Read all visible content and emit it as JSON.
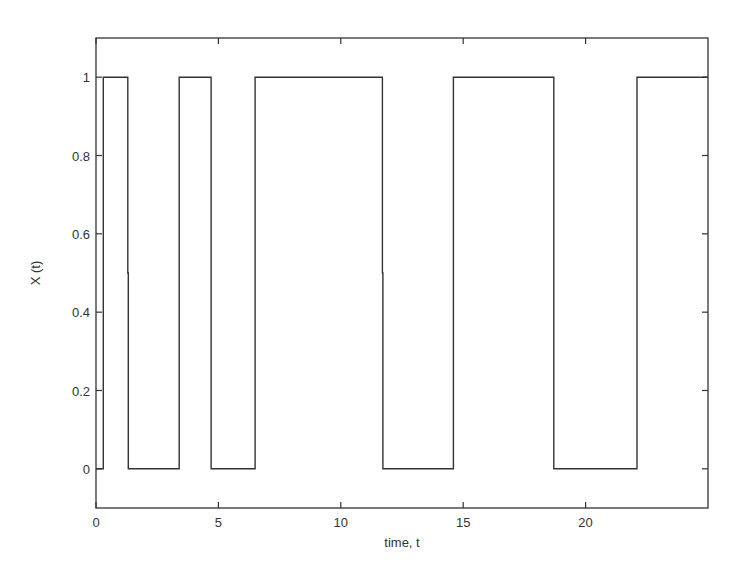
{
  "chart_data": {
    "type": "line",
    "style": "step",
    "title": "",
    "xlabel": "time, t",
    "ylabel": "X (t)",
    "xlim": [
      0,
      25
    ],
    "ylim": [
      -0.1,
      1.1
    ],
    "xticks": [
      0,
      5,
      10,
      15,
      20
    ],
    "xtick_labels": [
      "0",
      "5",
      "10",
      "15",
      "20"
    ],
    "yticks": [
      0,
      0.2,
      0.4,
      0.6,
      0.8,
      1
    ],
    "ytick_labels": [
      "0",
      "0.2",
      "0.4",
      "0.6",
      "0.8",
      "1"
    ],
    "grid": false,
    "legend": null,
    "series": [
      {
        "name": "X(t)",
        "color": "#333333",
        "x": [
          0,
          0.3,
          0.3,
          1.3,
          1.3,
          1.32,
          1.32,
          3.4,
          3.4,
          4.7,
          4.7,
          6.5,
          6.5,
          11.7,
          11.7,
          11.72,
          11.72,
          14.6,
          14.6,
          18.7,
          18.7,
          22.1,
          22.1,
          25
        ],
        "y": [
          0,
          0,
          1,
          1,
          0.5,
          0.5,
          0,
          0,
          1,
          1,
          0,
          0,
          1,
          1,
          0.5,
          0.5,
          0,
          0,
          1,
          1,
          0,
          0,
          1,
          1
        ]
      }
    ]
  }
}
